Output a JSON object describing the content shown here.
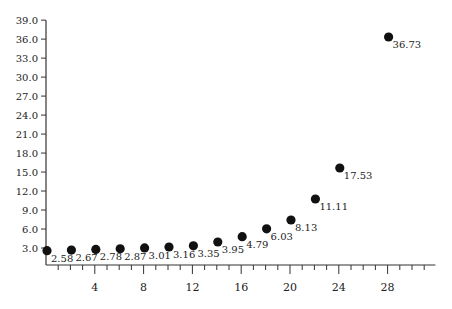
{
  "chart_data": {
    "type": "scatter",
    "title": "",
    "xlabel": "",
    "ylabel": "",
    "x": [
      0,
      2,
      4,
      6,
      8,
      10,
      12,
      14,
      16,
      18,
      20,
      22,
      24,
      28
    ],
    "series": [
      {
        "name": "values",
        "values": [
          2.58,
          2.67,
          2.78,
          2.87,
          3.01,
          3.16,
          3.35,
          3.95,
          4.79,
          6.03,
          8.13,
          11.11,
          17.53,
          36.73
        ],
        "labels": [
          "2.58",
          "2.67",
          "2.78",
          "2.87",
          "3.01",
          "3.16",
          "3.35",
          "3.95",
          "4.79",
          "6.03",
          "8.13",
          "11.11",
          "17.53",
          "36.73"
        ]
      }
    ],
    "xlim": [
      0,
      32
    ],
    "ylim": [
      0,
      39
    ],
    "x_ticks_major": [
      4,
      8,
      12,
      16,
      20,
      24,
      28
    ],
    "x_tick_labels": [
      "4",
      "8",
      "12",
      "16",
      "20",
      "24",
      "28"
    ],
    "x_ticks_minor_step": 1,
    "y_ticks": [
      3,
      6,
      9,
      12,
      15,
      18,
      21,
      24,
      27,
      30,
      33,
      36,
      39
    ],
    "y_tick_labels": [
      "3.0",
      "6.0",
      "9.0",
      "12.0",
      "15.0",
      "18.0",
      "21.0",
      "24.0",
      "27.0",
      "30.0",
      "33.0",
      "36.0",
      "39.0"
    ],
    "grid": false,
    "legend": null,
    "marker_color": "#111111",
    "axis_color": "#333333"
  }
}
